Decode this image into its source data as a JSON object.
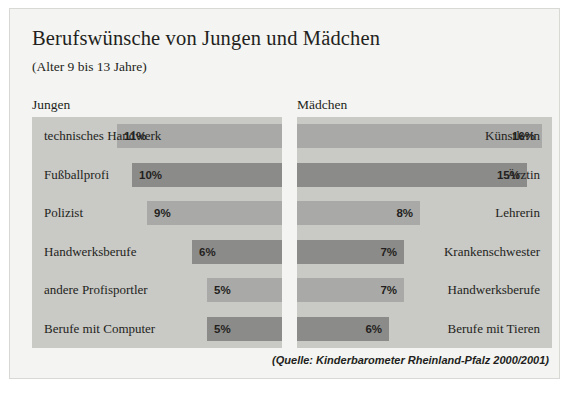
{
  "title": "Berufswünsche von Jungen und Mädchen",
  "subtitle": "(Alter 9 bis 13 Jahre)",
  "headers": {
    "left": "Jungen",
    "right": "Mädchen"
  },
  "source": "(Quelle: Kinderbarometer Rheinland-Pfalz 2000/2001)",
  "colors": {
    "page_background": "#ffffff",
    "figure_background": "#f4f4f2",
    "panel_background": "#c9c9c6",
    "bar_light": "#a9a9a7",
    "bar_dark": "#8b8b89",
    "text": "#231f20",
    "border": "#d8d8d4"
  },
  "chart_data": {
    "type": "bar",
    "title": "Berufswünsche von Jungen und Mädchen",
    "subtitle": "(Alter 9 bis 13 Jahre)",
    "xlabel": "",
    "ylabel": "",
    "grid": false,
    "orientation": "horizontal",
    "unit": "%",
    "xlim": [
      0,
      16
    ],
    "note": "(Quelle: Kinderbarometer Rheinland-Pfalz 2000/2001)",
    "series": [
      {
        "name": "Jungen",
        "direction": "right-to-left",
        "categories": [
          "technisches Handwerk",
          "Fußballprofi",
          "Polizist",
          "Handwerksberufe",
          "andere Profisportler",
          "Berufe mit Computer"
        ],
        "values": [
          11,
          10,
          9,
          6,
          5,
          5
        ],
        "value_labels": [
          "11%",
          "10%",
          "9%",
          "6%",
          "5%",
          "5%"
        ],
        "bar_shades": [
          "light",
          "dark",
          "light",
          "dark",
          "light",
          "dark"
        ]
      },
      {
        "name": "Mädchen",
        "direction": "left-to-right",
        "categories": [
          "Künstlerin",
          "Ärztin",
          "Lehrerin",
          "Krankenschwester",
          "Handwerksberufe",
          "Berufe mit Tieren"
        ],
        "values": [
          16,
          15,
          8,
          7,
          7,
          6
        ],
        "value_labels": [
          "16%",
          "15%",
          "8%",
          "7%",
          "7%",
          "6%"
        ],
        "bar_shades": [
          "light",
          "dark",
          "light",
          "dark",
          "light",
          "dark"
        ]
      }
    ]
  }
}
